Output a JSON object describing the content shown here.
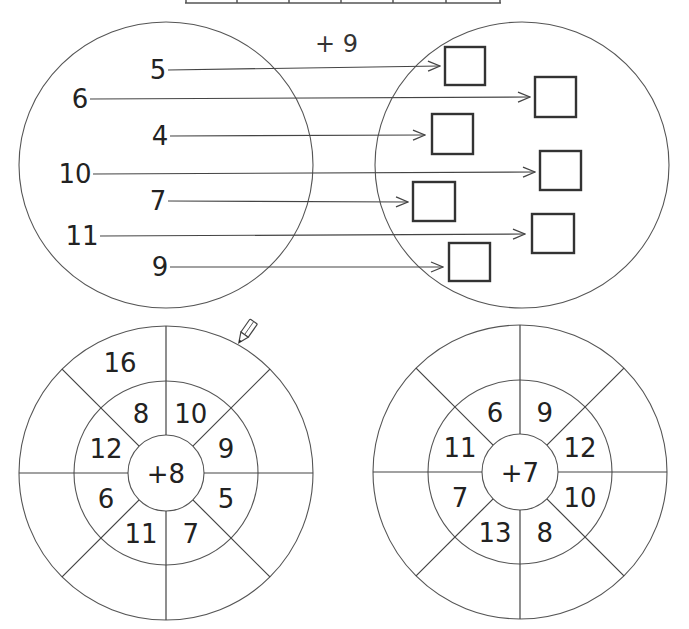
{
  "header_table": {
    "cells": [
      "",
      "",
      "",
      "",
      "",
      ""
    ]
  },
  "mapping_exercise": {
    "operation": "+ 9",
    "inputs": [
      {
        "value": "5",
        "x": 158,
        "y": 70,
        "arrow_end": [
          440,
          66
        ],
        "box": [
          445,
          47,
          40,
          38
        ]
      },
      {
        "value": "6",
        "x": 80,
        "y": 99,
        "arrow_end": [
          530,
          97
        ],
        "box": [
          535,
          77,
          41,
          40
        ]
      },
      {
        "value": "4",
        "x": 160,
        "y": 136,
        "arrow_end": [
          425,
          135
        ],
        "box": [
          432,
          114,
          41,
          40
        ]
      },
      {
        "value": "10",
        "x": 75,
        "y": 174,
        "arrow_end": [
          535,
          172
        ],
        "box": [
          540,
          151,
          41,
          39
        ]
      },
      {
        "value": "7",
        "x": 158,
        "y": 201,
        "arrow_end": [
          408,
          202
        ],
        "box": [
          413,
          182,
          42,
          39
        ]
      },
      {
        "value": "11",
        "x": 82,
        "y": 236,
        "arrow_end": [
          525,
          234
        ],
        "box": [
          532,
          214,
          42,
          39
        ]
      },
      {
        "value": "9",
        "x": 160,
        "y": 267,
        "arrow_end": [
          443,
          267
        ],
        "box": [
          449,
          243,
          41,
          38
        ]
      }
    ],
    "answers": [
      "",
      "",
      "",
      "",
      "",
      "",
      ""
    ]
  },
  "wheels": [
    {
      "center_label": "+8",
      "inner_values": [
        "8",
        "10",
        "9",
        "5",
        "7",
        "11",
        "6",
        "12"
      ],
      "outer_values": [
        "16",
        "",
        "",
        "",
        "",
        "",
        "",
        ""
      ]
    },
    {
      "center_label": "+7",
      "inner_values": [
        "6",
        "9",
        "12",
        "10",
        "8",
        "13",
        "7",
        "11"
      ],
      "outer_values": [
        "",
        "",
        "",
        "",
        "",
        "",
        "",
        ""
      ]
    }
  ],
  "decorations": {
    "pencil_icon": true
  }
}
